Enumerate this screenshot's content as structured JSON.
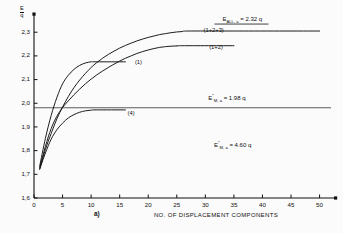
{
  "chart_data": {
    "type": "line",
    "title": "",
    "xlabel": "NO. OF DISPLACEMENT COMPONENTS",
    "ylabel": "E / q",
    "panel_label": "a)",
    "xlim": [
      0,
      52
    ],
    "ylim": [
      1.6,
      2.36
    ],
    "xticks": [
      0,
      5,
      10,
      15,
      20,
      25,
      30,
      35,
      40,
      45,
      50
    ],
    "yticks": [
      "1,6",
      "1,7",
      "1,8",
      "1,9",
      "2,0",
      "2,1",
      "2,2",
      "2,3"
    ],
    "ytick_values": [
      1.6,
      1.7,
      1.8,
      1.9,
      2.0,
      2.1,
      2.2,
      2.3
    ],
    "grid": false,
    "legend_position": "inline-curve-labels",
    "series": [
      {
        "name": "(1+2+3)",
        "label": "(1+2+3)",
        "label_x": 29.5,
        "label_y": 2.305,
        "plateau": 2.305,
        "points": [
          [
            1,
            1.722
          ],
          [
            2,
            1.805
          ],
          [
            3,
            1.872
          ],
          [
            4,
            1.934
          ],
          [
            5,
            1.984
          ],
          [
            6,
            2.028
          ],
          [
            7,
            2.066
          ],
          [
            8,
            2.098
          ],
          [
            9,
            2.126
          ],
          [
            10,
            2.151
          ],
          [
            11,
            2.172
          ],
          [
            12,
            2.19
          ],
          [
            13,
            2.206
          ],
          [
            14,
            2.22
          ],
          [
            15,
            2.233
          ],
          [
            16,
            2.244
          ],
          [
            17,
            2.254
          ],
          [
            18,
            2.263
          ],
          [
            19,
            2.271
          ],
          [
            20,
            2.278
          ],
          [
            21,
            2.284
          ],
          [
            22,
            2.29
          ],
          [
            23,
            2.294
          ],
          [
            24,
            2.298
          ],
          [
            25,
            2.301
          ],
          [
            26,
            2.303
          ],
          [
            27,
            2.305
          ],
          [
            35,
            2.305
          ],
          [
            50,
            2.305
          ]
        ]
      },
      {
        "name": "(1+2)",
        "label": "(1+2)",
        "label_x": 30.5,
        "label_y": 2.232,
        "plateau": 2.243,
        "points": [
          [
            1,
            1.728
          ],
          [
            2,
            1.818
          ],
          [
            3,
            1.893
          ],
          [
            4,
            1.945
          ],
          [
            5,
            1.982
          ],
          [
            6,
            2.01
          ],
          [
            7,
            2.036
          ],
          [
            8,
            2.06
          ],
          [
            9,
            2.082
          ],
          [
            10,
            2.102
          ],
          [
            11,
            2.12
          ],
          [
            12,
            2.136
          ],
          [
            13,
            2.151
          ],
          [
            14,
            2.165
          ],
          [
            15,
            2.178
          ],
          [
            16,
            2.19
          ],
          [
            17,
            2.2
          ],
          [
            18,
            2.21
          ],
          [
            19,
            2.218
          ],
          [
            20,
            2.225
          ],
          [
            21,
            2.231
          ],
          [
            22,
            2.236
          ],
          [
            23,
            2.239
          ],
          [
            24,
            2.241
          ],
          [
            25,
            2.242
          ],
          [
            26,
            2.243
          ],
          [
            35,
            2.243
          ]
        ]
      },
      {
        "name": "(1)",
        "label": "(1)",
        "label_x": 17.5,
        "label_y": 2.168,
        "plateau": 2.175,
        "points": [
          [
            1,
            1.735
          ],
          [
            2,
            1.852
          ],
          [
            3,
            1.948
          ],
          [
            4,
            2.024
          ],
          [
            5,
            2.082
          ],
          [
            6,
            2.118
          ],
          [
            7,
            2.143
          ],
          [
            8,
            2.16
          ],
          [
            9,
            2.17
          ],
          [
            10,
            2.175
          ],
          [
            11,
            2.175
          ],
          [
            16,
            2.175
          ]
        ]
      },
      {
        "name": "(4)",
        "label": "(4)",
        "label_x": 16.2,
        "label_y": 1.955,
        "plateau": 1.972,
        "points": [
          [
            1,
            1.722
          ],
          [
            2,
            1.79
          ],
          [
            3,
            1.848
          ],
          [
            4,
            1.888
          ],
          [
            5,
            1.916
          ],
          [
            6,
            1.938
          ],
          [
            7,
            1.952
          ],
          [
            8,
            1.962
          ],
          [
            9,
            1.968
          ],
          [
            10,
            1.971
          ],
          [
            11,
            1.972
          ],
          [
            16,
            1.972
          ]
        ]
      }
    ],
    "reference_lines": [
      {
        "name": "E*_M,a reference",
        "y": 1.981,
        "label_html": "E<sup>*</sup><sub>M, a</sub> = 1.98 q",
        "label_x": 30.5,
        "label_y": 2.012
      }
    ],
    "annotations": [
      {
        "name": "upper-bound-annotation",
        "label_html": "E<sub>ALL, a</sub> = 2.32 q",
        "x": 33.0,
        "y": 2.345
      },
      {
        "name": "lower-energy-annotation",
        "label_html": "E<sup>*</sup><sub>M, a</sub> = 4.60 q",
        "x": 31.5,
        "y": 1.816
      }
    ]
  }
}
